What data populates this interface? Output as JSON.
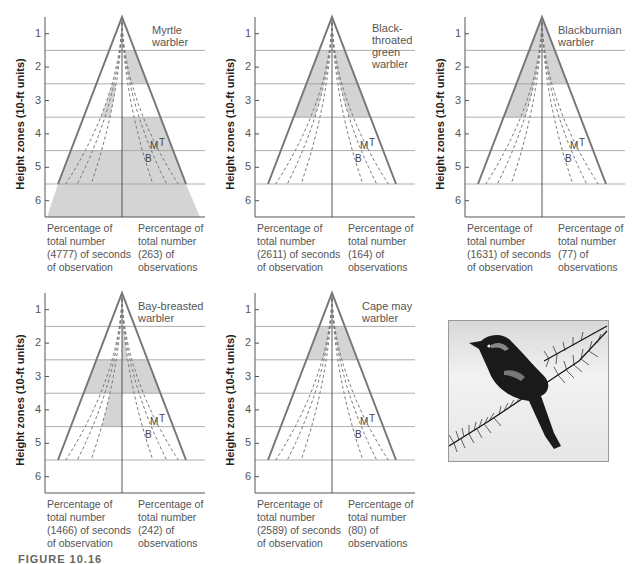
{
  "figure": {
    "caption": "FIGURE 10.16",
    "y_axis_label": "Height zones (10-ft units)",
    "y_ticks": [
      "1",
      "2",
      "3",
      "4",
      "5",
      "6"
    ],
    "curve_labels": {
      "m": "M",
      "t": "T",
      "b": "B"
    },
    "photo": {
      "alt": "Warbler perched on conifer branch"
    }
  },
  "panels": [
    {
      "title_lines": [
        "Myrtle",
        "warbler"
      ],
      "left_caption": [
        "Percentage of",
        "total number",
        "(4777) of seconds",
        "of observation"
      ],
      "right_caption": [
        "Percentage of",
        "total number",
        "(263) of",
        "observations"
      ],
      "seconds": 4777,
      "observations": 263
    },
    {
      "title_lines": [
        "Black-",
        "throated",
        "green",
        "warbler"
      ],
      "left_caption": [
        "Percentage of",
        "total number",
        "(2611) of seconds",
        "of observation"
      ],
      "right_caption": [
        "Percentage of",
        "total number",
        "(164) of",
        "observations"
      ],
      "seconds": 2611,
      "observations": 164
    },
    {
      "title_lines": [
        "Blackburnian",
        "warbler"
      ],
      "left_caption": [
        "Percentage of",
        "total number",
        "(1631) of seconds",
        "of observation"
      ],
      "right_caption": [
        "Percentage of",
        "total number",
        "(77) of",
        "observations"
      ],
      "seconds": 1631,
      "observations": 77
    },
    {
      "title_lines": [
        "Bay-breasted",
        "warbler"
      ],
      "left_caption": [
        "Percentage of",
        "total number",
        "(1466) of seconds",
        "of observation"
      ],
      "right_caption": [
        "Percentage of",
        "total number",
        "(242) of",
        "observations"
      ],
      "seconds": 1466,
      "observations": 242
    },
    {
      "title_lines": [
        "Cape may",
        "warbler"
      ],
      "left_caption": [
        "Percentage of",
        "total number",
        "(2589) of seconds",
        "of observation"
      ],
      "right_caption": [
        "Percentage of",
        "total number",
        "(80) of",
        "observations"
      ],
      "seconds": 2589,
      "observations": 80
    }
  ],
  "colors": {
    "shade": "#d4d4d4",
    "outline": "#777777",
    "dashed": "#777777",
    "gridline": "#999999",
    "axis": "#555555"
  },
  "chart_data": [
    {
      "type": "area",
      "title": "Myrtle warbler",
      "ylabel": "Height zones (10-ft units)",
      "y_ticks": [
        1,
        2,
        3,
        4,
        5,
        6
      ],
      "ylim": [
        0.5,
        6.5
      ],
      "xlabel_left": "Percentage of total number (4777) of seconds of observation",
      "xlabel_right": "Percentage of total number (263) of observations",
      "curves": [
        "T",
        "M",
        "B"
      ],
      "shaded_zones": {
        "left_seconds": [
          {
            "zone": 3,
            "extent": "outer-to-B? partial band"
          },
          {
            "zone": 5,
            "extent": "full"
          },
          {
            "zone": 6,
            "extent": "full"
          }
        ],
        "right_observations": [
          {
            "zone": 2,
            "extent": "outer band"
          },
          {
            "zone": 4,
            "extent": "full"
          },
          {
            "zone": 5,
            "extent": "full"
          },
          {
            "zone": 6,
            "extent": "full"
          }
        ]
      }
    },
    {
      "type": "area",
      "title": "Black-throated green warbler",
      "ylabel": "Height zones (10-ft units)",
      "y_ticks": [
        1,
        2,
        3,
        4,
        5,
        6
      ],
      "ylim": [
        0.5,
        6.5
      ],
      "xlabel_left": "Percentage of total number (2611) of seconds of observation",
      "xlabel_right": "Percentage of total number (164) of observations",
      "curves": [
        "T",
        "M",
        "B"
      ],
      "shaded_zones": {
        "left_seconds": [
          {
            "zone": 2,
            "extent": "outer band"
          },
          {
            "zone": 3,
            "extent": "outer band"
          }
        ],
        "right_observations": [
          {
            "zone": 2,
            "extent": "outer band"
          },
          {
            "zone": 3,
            "extent": "outer band"
          }
        ]
      }
    },
    {
      "type": "area",
      "title": "Blackburnian warbler",
      "ylabel": "Height zones (10-ft units)",
      "y_ticks": [
        1,
        2,
        3,
        4,
        5,
        6
      ],
      "ylim": [
        0.5,
        6.5
      ],
      "xlabel_left": "Percentage of total number (1631) of seconds of observation",
      "xlabel_right": "Percentage of total number (77) of observations",
      "curves": [
        "T",
        "M",
        "B"
      ],
      "shaded_zones": {
        "left_seconds": [
          {
            "zone": 1,
            "extent": "outer band"
          },
          {
            "zone": 2,
            "extent": "outer band"
          },
          {
            "zone": 3,
            "extent": "outer band"
          }
        ],
        "right_observations": [
          {
            "zone": 1,
            "extent": "outer band"
          },
          {
            "zone": 2,
            "extent": "outer band"
          }
        ]
      }
    },
    {
      "type": "area",
      "title": "Bay-breasted warbler",
      "ylabel": "Height zones (10-ft units)",
      "y_ticks": [
        1,
        2,
        3,
        4,
        5,
        6
      ],
      "ylim": [
        0.5,
        6.5
      ],
      "xlabel_left": "Percentage of total number (1466) of seconds of observation",
      "xlabel_right": "Percentage of total number (242) of observations",
      "curves": [
        "T",
        "M",
        "B"
      ],
      "shaded_zones": {
        "left_seconds": [
          {
            "zone": 3,
            "extent": "full"
          },
          {
            "zone": 4,
            "extent": "inner to B"
          }
        ],
        "right_observations": [
          {
            "zone": 2,
            "extent": "inner band"
          },
          {
            "zone": 3,
            "extent": "full"
          }
        ]
      }
    },
    {
      "type": "area",
      "title": "Cape may warbler",
      "ylabel": "Height zones (10-ft units)",
      "y_ticks": [
        1,
        2,
        3,
        4,
        5,
        6
      ],
      "ylim": [
        0.5,
        6.5
      ],
      "xlabel_left": "Percentage of total number (2589) of seconds of observation",
      "xlabel_right": "Percentage of total number (80) of observations",
      "curves": [
        "T",
        "M",
        "B"
      ],
      "shaded_zones": {
        "left_seconds": [
          {
            "zone": 2,
            "extent": "outer band"
          }
        ],
        "right_observations": [
          {
            "zone": 2,
            "extent": "outer band"
          }
        ]
      }
    }
  ]
}
